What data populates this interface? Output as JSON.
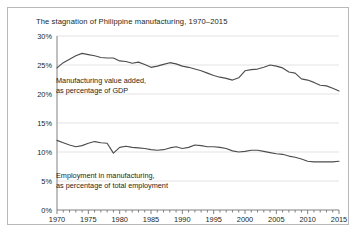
{
  "figure": {
    "title": "The stagnation of Philippine manufacturing, 1970–2015",
    "border_color": "#b9b9b9",
    "background": "#ffffff"
  },
  "chart_data": {
    "type": "line",
    "title": "The stagnation of Philippine manufacturing, 1970–2015",
    "xlabel": "",
    "ylabel": "",
    "xlim": [
      1970,
      2015
    ],
    "ylim": [
      0,
      30
    ],
    "grid": true,
    "grid_axis": "y",
    "legend_position": "inline-annotation",
    "line_color": "#4d4d4d",
    "grid_color": "#e3e3e3",
    "axis_color": "#808080",
    "ytick_labels": [
      "0%",
      "5%",
      "10%",
      "15%",
      "20%",
      "25%",
      "30%"
    ],
    "ytick_values": [
      0,
      5,
      10,
      15,
      20,
      25,
      30
    ],
    "xtick_labels": [
      "1970",
      "1975",
      "1980",
      "1985",
      "1990",
      "1995",
      "2000",
      "2005",
      "2010",
      "2015"
    ],
    "xtick_values": [
      1970,
      1975,
      1980,
      1985,
      1990,
      1995,
      2000,
      2005,
      2010,
      2015
    ],
    "minor_xtick_interval": 1,
    "x": [
      1970,
      1971,
      1972,
      1973,
      1974,
      1975,
      1976,
      1977,
      1978,
      1979,
      1980,
      1981,
      1982,
      1983,
      1984,
      1985,
      1986,
      1987,
      1988,
      1989,
      1990,
      1991,
      1992,
      1993,
      1994,
      1995,
      1996,
      1997,
      1998,
      1999,
      2000,
      2001,
      2002,
      2003,
      2004,
      2005,
      2006,
      2007,
      2008,
      2009,
      2010,
      2011,
      2012,
      2013,
      2014,
      2015
    ],
    "series": [
      {
        "name": "Manufacturing value added, as percentage of GDP",
        "annotation": [
          "Manufacturing value added,",
          "as percentage of GDP"
        ],
        "values": [
          24.5,
          25.4,
          26.0,
          26.6,
          27.0,
          26.8,
          26.6,
          26.3,
          26.2,
          26.2,
          25.7,
          25.6,
          25.3,
          25.5,
          25.1,
          24.6,
          24.8,
          25.1,
          25.4,
          25.2,
          24.8,
          24.6,
          24.3,
          24.0,
          23.6,
          23.2,
          22.9,
          22.7,
          22.4,
          22.8,
          24.0,
          24.2,
          24.3,
          24.6,
          25.0,
          24.8,
          24.5,
          23.8,
          23.6,
          22.6,
          22.4,
          22.0,
          21.5,
          21.4,
          21.0,
          20.5
        ]
      },
      {
        "name": "Employment in manufacturing, as percentage of total employment",
        "annotation": [
          "Employment in manufacturing,",
          "as percentage of total employment"
        ],
        "values": [
          12.0,
          11.6,
          11.2,
          10.9,
          11.1,
          11.5,
          11.8,
          11.6,
          11.5,
          9.8,
          10.8,
          11.0,
          10.8,
          10.7,
          10.6,
          10.4,
          10.3,
          10.4,
          10.7,
          10.9,
          10.6,
          10.8,
          11.2,
          11.1,
          10.9,
          10.9,
          10.8,
          10.6,
          10.2,
          10.0,
          10.1,
          10.3,
          10.3,
          10.1,
          9.9,
          9.7,
          9.6,
          9.3,
          9.1,
          8.8,
          8.4,
          8.3,
          8.3,
          8.3,
          8.3,
          8.4
        ]
      }
    ]
  }
}
